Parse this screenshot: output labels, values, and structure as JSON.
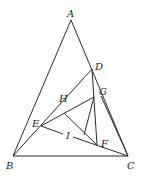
{
  "diagram": {
    "type": "geometry",
    "points": {
      "A": {
        "label": "A",
        "x": 71,
        "y": 20,
        "lx": 67,
        "ly": 17
      },
      "B": {
        "label": "B",
        "x": 13,
        "y": 156,
        "lx": 6,
        "ly": 169
      },
      "C": {
        "label": "C",
        "x": 128,
        "y": 156,
        "lx": 127,
        "ly": 169
      },
      "D": {
        "label": "D",
        "x": 92,
        "y": 69,
        "lx": 95,
        "ly": 70
      },
      "G": {
        "label": "G",
        "x": 94,
        "y": 97,
        "lx": 99,
        "ly": 95
      },
      "E": {
        "label": "E",
        "x": 41,
        "y": 126,
        "lx": 32,
        "ly": 127
      },
      "F": {
        "label": "F",
        "x": 97,
        "y": 145,
        "lx": 101,
        "ly": 147
      },
      "H": {
        "label": "H",
        "lx": 59,
        "ly": 102
      },
      "I": {
        "label": "I",
        "lx": 66,
        "ly": 139
      }
    },
    "segments": [
      [
        "A",
        "B"
      ],
      [
        "A",
        "C"
      ],
      [
        "B",
        "C"
      ],
      [
        "B",
        "D"
      ],
      [
        "E",
        "G"
      ],
      [
        "E",
        "C"
      ],
      [
        "D",
        "F"
      ],
      [
        "G",
        "C"
      ]
    ]
  }
}
